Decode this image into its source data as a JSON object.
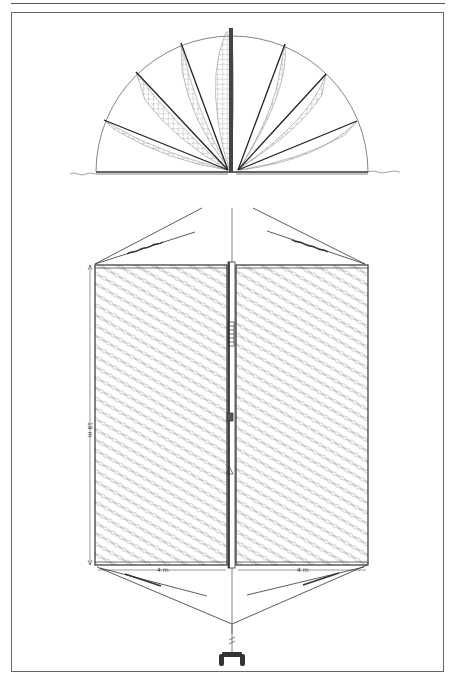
{
  "figure": {
    "type": "technical line drawing",
    "top_view": {
      "spokes_left": 4,
      "spokes_right": 3,
      "center_post": 1
    },
    "dimensions": {
      "height_label": "18 m",
      "left_width_label": "4 m",
      "right_width_label": "4 m"
    }
  },
  "colors": {
    "ink": "#2a2a2a",
    "frame": "#666666",
    "background": "#ffffff"
  }
}
